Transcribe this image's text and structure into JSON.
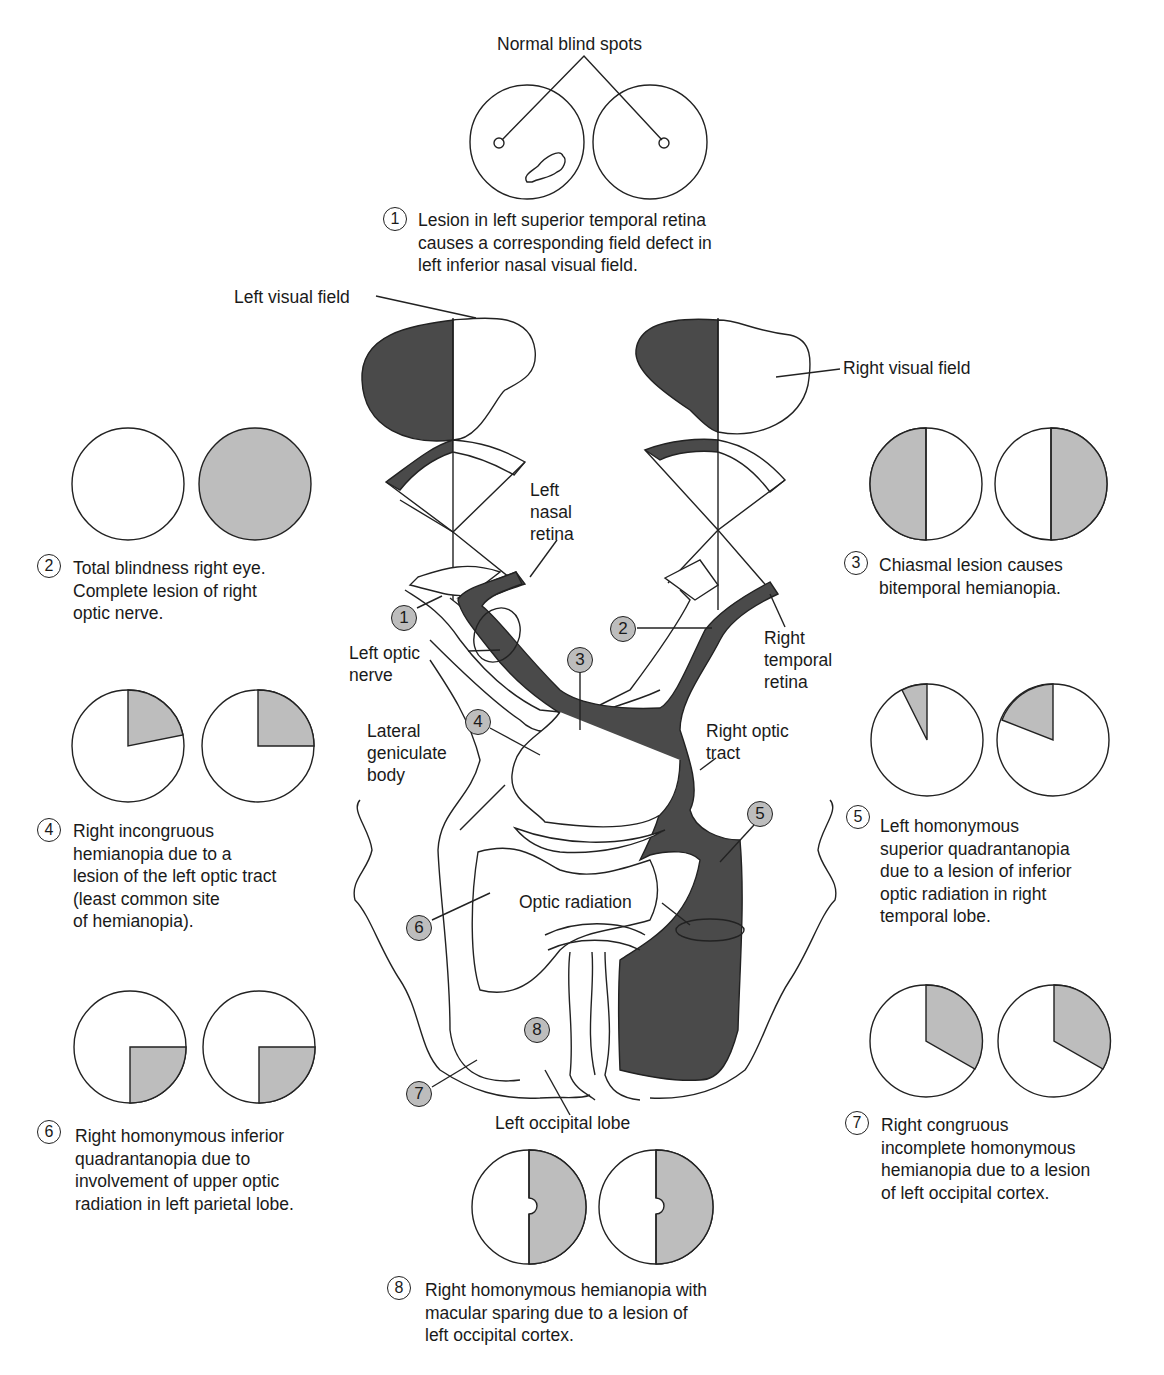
{
  "colors": {
    "defect_gray": "#bdbdbd",
    "pathway_dark": "#4a4a4a",
    "outline": "#222222",
    "background": "#ffffff"
  },
  "top": {
    "title": "Normal blind spots"
  },
  "anatomy_labels": {
    "left_visual_field": "Left visual field",
    "right_visual_field": "Right visual field",
    "left_nasal_retina": "Left\nnasal\nretina",
    "right_temporal_retina": "Right\ntemporal\nretina",
    "left_optic_nerve": "Left optic\nnerve",
    "lateral_geniculate_body": "Lateral\ngeniculate\nbody",
    "right_optic_tract": "Right optic\ntract",
    "optic_radiation": "Optic radiation",
    "left_occipital_lobe": "Left occipital lobe"
  },
  "markers": [
    "1",
    "2",
    "3",
    "4",
    "5",
    "6",
    "7",
    "8"
  ],
  "lesions": [
    {
      "num": "1",
      "caption": "Lesion in left superior temporal retina\ncauses a corresponding field defect in\nleft inferior nasal visual field.",
      "left_field": "inferior nasal scotoma",
      "right_field": "normal"
    },
    {
      "num": "2",
      "caption": "Total blindness right eye.\nComplete lesion of right\noptic nerve.",
      "left_field": "normal",
      "right_field": "fully blind"
    },
    {
      "num": "3",
      "caption": "Chiasmal lesion causes\nbitemporal hemianopia.",
      "left_field": "left half blind",
      "right_field": "right half blind"
    },
    {
      "num": "4",
      "caption": "Right incongruous\nhemianopia due to a\nlesion of the left optic tract\n(least common site\nof hemianopia).",
      "left_field": "upper-right partial wedge",
      "right_field": "upper-right quadrant"
    },
    {
      "num": "5",
      "caption": "Left homonymous\nsuperior quadrantanopia\ndue to a lesion of inferior\noptic radiation in right\ntemporal lobe.",
      "left_field": "narrow upper-left wedge",
      "right_field": "upper-left wedge"
    },
    {
      "num": "6",
      "caption": "Right homonymous inferior\nquadrantanopia due to\ninvolvement of upper optic\nradiation in left parietal lobe.",
      "left_field": "lower-right quadrant",
      "right_field": "lower-right quadrant"
    },
    {
      "num": "7",
      "caption": "Right congruous\nincomplete homonymous\nhemianopia due to a lesion\nof left occipital cortex.",
      "left_field": "upper-right sector",
      "right_field": "upper-right sector"
    },
    {
      "num": "8",
      "caption": "Right homonymous hemianopia with\nmacular sparing due to a lesion of\nleft occipital cortex.",
      "left_field": "right half with macular sparing",
      "right_field": "right half with macular sparing"
    }
  ]
}
